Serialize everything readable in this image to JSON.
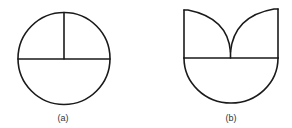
{
  "figures": [
    {
      "id": "a",
      "label": "(a)",
      "description": "Circle divided by a horizontal diameter and a vertical radius from the top to the center"
    },
    {
      "id": "b",
      "label": "(b)",
      "description": "Shape with a semicircular bottom, a horizontal line, and two quarter-arcs meeting in the middle forming a V/tulip top with vertical sides"
    }
  ],
  "colors": {
    "stroke": "#1a1a1a",
    "label": "#333333",
    "background": "#ffffff"
  }
}
